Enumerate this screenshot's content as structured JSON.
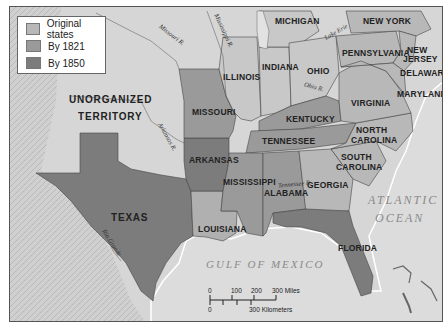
{
  "legend": {
    "items": [
      {
        "label": "Original states",
        "color": "#b8b8b8"
      },
      {
        "label": "By 1821",
        "color": "#9a9a9a"
      },
      {
        "label": "By 1850",
        "color": "#7c7c7c"
      }
    ]
  },
  "states": {
    "michigan": "MICHIGAN",
    "new_york": "NEW YORK",
    "pennsylvania": "PENNSYLVANIA",
    "new_jersey": "NEW\nJERSEY",
    "new_jersey_1": "NEW",
    "new_jersey_2": "JERSEY",
    "delaware": "DELAWARE",
    "maryland": "MARYLAND",
    "illinois": "ILLINOIS",
    "indiana": "INDIANA",
    "ohio": "OHIO",
    "virginia": "VIRGINIA",
    "kentucky": "KENTUCKY",
    "missouri": "MISSOURI",
    "tennessee": "TENNESSEE",
    "north_carolina_1": "NORTH",
    "north_carolina_2": "CAROLINA",
    "south_carolina_1": "SOUTH",
    "south_carolina_2": "CAROLINA",
    "arkansas": "ARKANSAS",
    "mississippi": "MISSISSIPPI",
    "alabama": "ALABAMA",
    "georgia": "GEORGIA",
    "louisiana": "LOUISIANA",
    "texas": "TEXAS",
    "florida": "FLORIDA",
    "unorganized_1": "UNORGANIZED",
    "unorganized_2": "TERRITORY"
  },
  "water": {
    "atlantic_1": "ATLANTIC",
    "atlantic_2": "OCEAN",
    "gulf": "GULF OF MEXICO"
  },
  "rivers": {
    "missouri": "Missouri R.",
    "mississippi": "Mississippi R.",
    "arkansas": "Arkansas R.",
    "ohio": "Ohio R.",
    "tennessee": "Tennessee R.",
    "lake_erie": "Lake Erie",
    "rio_grande": "Rio Grande"
  },
  "scale_bar": {
    "miles_ticks": [
      "0",
      "100",
      "200",
      "300 Miles"
    ],
    "km_ticks": [
      "0",
      "300 Kilometers"
    ]
  },
  "colors": {
    "original": "#b8b8b8",
    "by_1821": "#9a9a9a",
    "by_1850": "#7c7c7c",
    "land": "#d6d6d6",
    "water": "#d9d9d9",
    "terrain": "#c4c4c4"
  }
}
